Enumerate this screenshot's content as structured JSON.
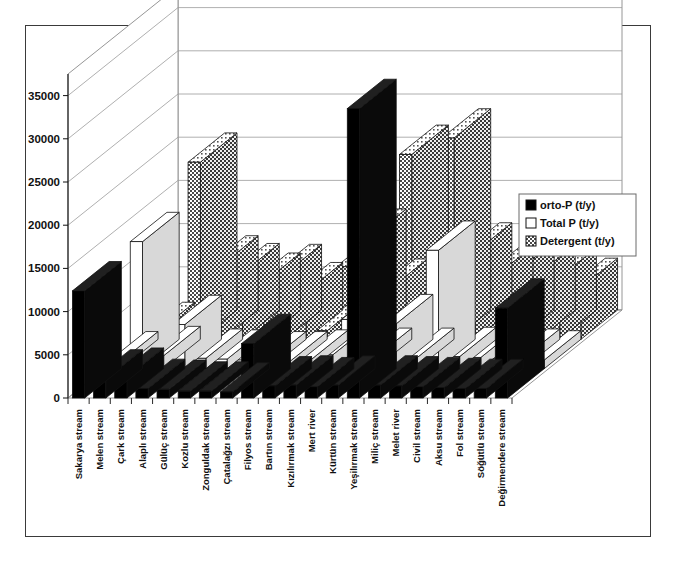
{
  "chart_data": {
    "type": "bar",
    "title": "",
    "subtitle": "",
    "xlabel": "",
    "ylabel": "",
    "ylim": [
      0,
      37500
    ],
    "yticks": [
      0,
      5000,
      10000,
      15000,
      20000,
      25000,
      30000,
      35000
    ],
    "ytick_labels": [
      "0",
      "5000",
      "10000",
      "15000",
      "20000",
      "25000",
      "30000",
      "35000"
    ],
    "grid": true,
    "three_d": true,
    "legend_position": "right-inside",
    "categories": [
      "Sakarya stream",
      "Melen stream",
      "Çark stream",
      "Alaplı stream",
      "Gülüç stream",
      "Kozlu stream",
      "Zonguldak stream",
      "Çatalağzı stream",
      "Filyos stream",
      "Bartın stream",
      "Kızılırmak stream",
      "Mert river",
      "Kürtün stream",
      "Yeşilırmak stream",
      "Miliç stream",
      "Melet river",
      "Civil stream",
      "Aksu stream",
      "Fol stream",
      "Söğütlü stream",
      "Değirmendere stream"
    ],
    "series": [
      {
        "name": "orto-P (t/y)",
        "key": "orto-P",
        "fill": "solid-black",
        "color": "#000000",
        "values": [
          12400,
          2200,
          2400,
          1100,
          1000,
          800,
          800,
          700,
          6300,
          1400,
          1500,
          1300,
          1500,
          33500,
          1500,
          1400,
          1300,
          1200,
          1100,
          1100,
          10400
        ]
      },
      {
        "name": "Total P (t/y)",
        "key": "Total P",
        "fill": "white",
        "color": "#ffffff",
        "values": [
          900,
          14700,
          1500,
          5100,
          1200,
          1100,
          1000,
          900,
          900,
          1100,
          1600,
          5700,
          1300,
          5200,
          1300,
          13700,
          1400,
          1300,
          1200,
          1200,
          1000
        ]
      },
      {
        "name": "Detergent (t/y)",
        "key": "Detergent",
        "fill": "dotted-gray",
        "color": "#c8c8c8",
        "values": [
          900,
          1200,
          20500,
          8600,
          7700,
          6600,
          7600,
          5500,
          1000,
          8400,
          11700,
          5900,
          21400,
          1400,
          23300,
          10100,
          7400,
          7900,
          7600,
          7200,
          6000
        ]
      }
    ],
    "legend": [
      {
        "label": "orto-P (t/y)",
        "swatch": "solid-black"
      },
      {
        "label": "Total P (t/y)",
        "swatch": "white"
      },
      {
        "label": "Detergent (t/y)",
        "swatch": "dotted-gray"
      }
    ]
  },
  "figure": {
    "caption": ""
  }
}
